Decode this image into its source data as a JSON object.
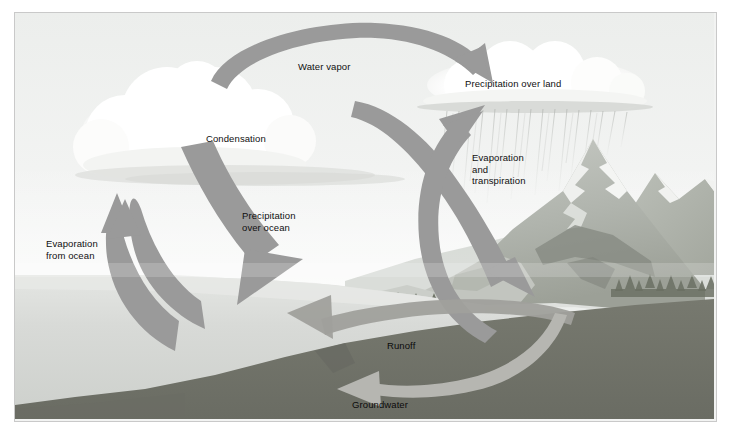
{
  "figure": {
    "kind": "water-cycle-diagram",
    "border_color": "#c9c9c9",
    "background": "#f2f3f2"
  },
  "palette": {
    "sky_top": "#eceeec",
    "sky_low": "#f7f8f7",
    "cloud": "#ffffff",
    "cloud_shadow": "#dcdedc",
    "arrow_gray": "#9a9a9a",
    "arrow_gray_dark": "#8b8b8b",
    "arrow_light": "#b6b6b1",
    "ocean": "#dcdedb",
    "ocean_deep": "#cfd1ce",
    "land_far": "#cdd0cc",
    "land_mid": "#b9bdb7",
    "mountain_rock": "#b0b4ae",
    "mountain_dark": "#8d9189",
    "snow": "#f4f5f3",
    "forest": "#6c7168",
    "subsurface": "#70726e",
    "subsurface_dark": "#646661",
    "rain_streak": "#b9bcb8",
    "label_text": "#101010"
  },
  "labels": [
    {
      "id": "water_vapor",
      "text": "Water vapor"
    },
    {
      "id": "condensation",
      "text": "Condensation"
    },
    {
      "id": "precipitation_over_ocean",
      "text": "Precipitation\nover ocean"
    },
    {
      "id": "evaporation_from_ocean",
      "text": "Evaporation\nfrom ocean"
    },
    {
      "id": "precipitation_over_land",
      "text": "Precipitation over land"
    },
    {
      "id": "evaporation_and_transpiration",
      "text": "Evaporation\nand\ntranspiration"
    },
    {
      "id": "runoff",
      "text": "Runoff"
    },
    {
      "id": "groundwater",
      "text": "Groundwater"
    }
  ],
  "flows": [
    {
      "id": "water-vapor-arrow",
      "label": "Water vapor",
      "from": "ocean clouds",
      "to": "land clouds",
      "direction": "left-to-right",
      "color": "#9a9a9a"
    },
    {
      "id": "precip-ocean-arrow",
      "label": "Precipitation over ocean",
      "from": "cloud",
      "to": "ocean",
      "direction": "downward",
      "color": "#9a9a9a"
    },
    {
      "id": "evap-ocean-arrow",
      "label": "Evaporation from ocean",
      "from": "ocean",
      "to": "cloud",
      "direction": "upward",
      "color": "#9a9a9a"
    },
    {
      "id": "precip-land-arrow",
      "label": "Precipitation over land",
      "from": "cloud",
      "to": "mountains",
      "direction": "downward",
      "color": "#9a9a9a"
    },
    {
      "id": "evap-transp-arrow",
      "label": "Evaporation and transpiration",
      "from": "land",
      "to": "cloud",
      "direction": "upward",
      "color": "#9a9a9a"
    },
    {
      "id": "runoff-arrow",
      "label": "Runoff",
      "from": "land surface",
      "to": "ocean",
      "direction": "right-to-left",
      "color": "#9a9a9a"
    },
    {
      "id": "groundwater-arrow",
      "label": "Groundwater",
      "from": "subsurface",
      "to": "ocean",
      "direction": "right-to-left",
      "color": "#b6b6b1"
    }
  ],
  "scene_elements": [
    {
      "id": "ocean",
      "name": "ocean"
    },
    {
      "id": "ocean-cloud",
      "name": "cumulus cloud over ocean"
    },
    {
      "id": "land-cloud",
      "name": "rain cloud over land"
    },
    {
      "id": "rain-streaks",
      "name": "rain falling over land"
    },
    {
      "id": "mountain-range",
      "name": "snow-capped mountains"
    },
    {
      "id": "mountain-lake",
      "name": "mountain lake"
    },
    {
      "id": "forest",
      "name": "coniferous forest"
    },
    {
      "id": "subsurface",
      "name": "underground rock layer"
    }
  ]
}
